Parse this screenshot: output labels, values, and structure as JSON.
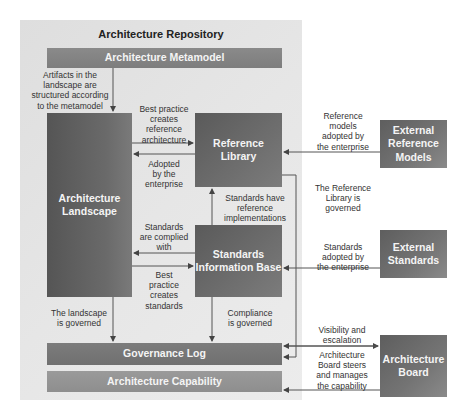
{
  "repository": {
    "title": "Architecture Repository"
  },
  "boxes": {
    "metamodel": "Architecture Metamodel",
    "landscape_line1": "Architecture",
    "landscape_line2": "Landscape",
    "reference_library_line1": "Reference",
    "reference_library_line2": "Library",
    "sib_line1": "Standards",
    "sib_line2": "Information Base",
    "governance_log": "Governance Log",
    "capability": "Architecture Capability",
    "ext_ref_line1": "External",
    "ext_ref_line2": "Reference",
    "ext_ref_line3": "Models",
    "ext_std_line1": "External",
    "ext_std_line2": "Standards",
    "board_line1": "Architecture",
    "board_line2": "Board"
  },
  "labels": {
    "artifacts": [
      "Artifacts in the",
      "landscape are",
      "structured according",
      "to the metamodel"
    ],
    "best_practice_ref": [
      "Best practice",
      "creates",
      "reference",
      "architecture"
    ],
    "adopted": [
      "Adopted",
      "by the",
      "enterprise"
    ],
    "standards_have": [
      "Standards have",
      "reference",
      "implementations"
    ],
    "complied": [
      "Standards",
      "are complied",
      "with"
    ],
    "best_practice_std": [
      "Best",
      "practice",
      "creates",
      "standards"
    ],
    "landscape_governed": [
      "The landscape",
      "is governed"
    ],
    "compliance_governed": [
      "Compliance",
      "is governed"
    ],
    "ref_models_adopted": [
      "Reference",
      "models",
      "adopted by",
      "the enterprise"
    ],
    "ref_lib_governed": [
      "The Reference",
      "Library is",
      "governed"
    ],
    "standards_adopted": [
      "Standards",
      "adopted by",
      "the enterprise"
    ],
    "visibility": [
      "Visibility and",
      "escalation"
    ],
    "board_steers": [
      "Architecture",
      "Board steers",
      "and manages",
      "the capability"
    ]
  },
  "colors": {
    "repository_bg": "#e4e4e4",
    "dark_box": "#626262",
    "bar": "#858585",
    "line": "#555555"
  }
}
